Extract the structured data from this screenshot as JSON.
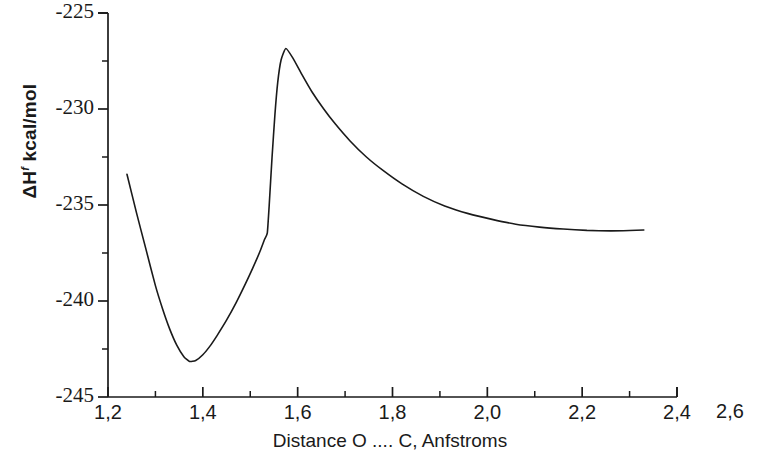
{
  "chart_data": {
    "type": "line",
    "title": "",
    "xlabel": "Distance O .... C, Anfstroms",
    "ylabel_text": "ΔHf  kcal/mol",
    "ylabel_main": "ΔH",
    "ylabel_sup": "f",
    "ylabel_unit": " kcal/mol",
    "xlim": [
      1.2,
      2.4
    ],
    "ylim": [
      -245,
      -225
    ],
    "grid": false,
    "legend": null,
    "legend_position": "none",
    "x_major_ticks": [
      1.2,
      1.4,
      1.6,
      1.8,
      2.0,
      2.2,
      2.4
    ],
    "x_minor_ticks": [
      1.3,
      1.5,
      1.7,
      1.9,
      2.1,
      2.3
    ],
    "x_tick_labels": [
      "1,2",
      "1,4",
      "1,6",
      "1,8",
      "2,0",
      "2,2",
      "2,4"
    ],
    "y_major_ticks": [
      -245,
      -240,
      -235,
      -230,
      -225
    ],
    "y_minor_ticks": [
      -242.5,
      -237.5,
      -232.5,
      -227.5
    ],
    "y_tick_labels": [
      "-245",
      "-240",
      "-235",
      "-230",
      "-225"
    ],
    "outside_label": "2,6",
    "decimal_separator": ",",
    "line_color": "#1a1a1a",
    "line_width": 1.6,
    "series": [
      {
        "name": "Heat of formation vs O...C distance",
        "x": [
          1.24,
          1.26,
          1.28,
          1.3,
          1.315,
          1.33,
          1.345,
          1.36,
          1.372,
          1.385,
          1.4,
          1.415,
          1.43,
          1.45,
          1.47,
          1.49,
          1.505,
          1.52,
          1.53,
          1.536,
          1.54,
          1.546,
          1.552,
          1.558,
          1.565,
          1.575,
          1.59,
          1.61,
          1.63,
          1.655,
          1.68,
          1.71,
          1.745,
          1.78,
          1.82,
          1.865,
          1.91,
          1.96,
          2.01,
          2.06,
          2.11,
          2.16,
          2.21,
          2.26,
          2.3,
          2.33
        ],
        "y": [
          -233.4,
          -235.4,
          -237.3,
          -239.2,
          -240.4,
          -241.45,
          -242.3,
          -242.9,
          -243.15,
          -243.1,
          -242.8,
          -242.35,
          -241.8,
          -241.0,
          -240.1,
          -239.1,
          -238.3,
          -237.45,
          -236.8,
          -236.45,
          -235.0,
          -232.5,
          -230.3,
          -228.6,
          -227.45,
          -226.85,
          -227.35,
          -228.25,
          -229.1,
          -230.0,
          -230.8,
          -231.65,
          -232.5,
          -233.2,
          -233.9,
          -234.55,
          -235.05,
          -235.45,
          -235.75,
          -236.0,
          -236.15,
          -236.25,
          -236.32,
          -236.35,
          -236.33,
          -236.3
        ]
      }
    ],
    "annotations": [
      {
        "name": "minimum",
        "x": 1.372,
        "y": -243.15,
        "label": ""
      },
      {
        "name": "maximum",
        "x": 1.575,
        "y": -226.85,
        "label": ""
      },
      {
        "name": "kink",
        "x": 1.536,
        "y": -236.45,
        "label": ""
      }
    ]
  }
}
